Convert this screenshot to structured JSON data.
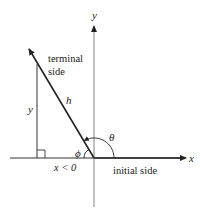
{
  "diagram": {
    "title_partial": "y  … g",
    "axes": {
      "x_label": "x",
      "y_label": "y"
    },
    "labels": {
      "terminal_line1": "terminal",
      "terminal_line2": "side",
      "hypotenuse": "h",
      "vertical_leg": "y",
      "horizontal_leg": "x < 0",
      "reference_angle": "ϕ",
      "angle": "θ",
      "initial_side": "initial side"
    },
    "colors": {
      "line": "#222222",
      "axis": "#555555",
      "background": "#ffffff"
    }
  }
}
